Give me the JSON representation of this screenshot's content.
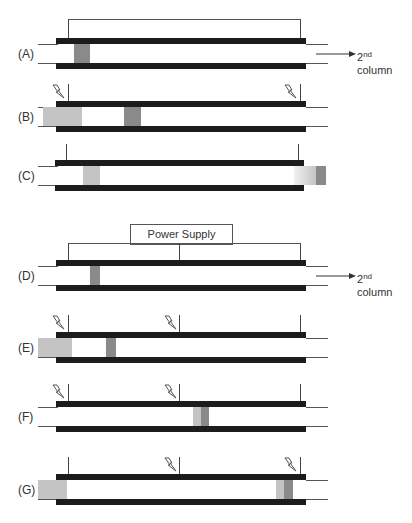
{
  "figure": {
    "colors": {
      "bar": "#1c1c1c",
      "line": "#555555",
      "band_dark": "#8a8a8a",
      "band_light": "#c4c4c4",
      "background": "#ffffff"
    },
    "arrow_text_main": "2",
    "arrow_text_sup": "nd",
    "arrow_text_sub": "column",
    "power_supply_label": "Power Supply",
    "panels": [
      {
        "id": "A",
        "label": "(A)"
      },
      {
        "id": "B",
        "label": "(B)"
      },
      {
        "id": "C",
        "label": "(C)"
      },
      {
        "id": "D",
        "label": "(D)"
      },
      {
        "id": "E",
        "label": "(E)"
      },
      {
        "id": "F",
        "label": "(F)"
      },
      {
        "id": "G",
        "label": "(G)"
      }
    ],
    "icons": {
      "lightning": "lightning-bolt-icon",
      "arrow": "arrow-right-icon"
    }
  }
}
